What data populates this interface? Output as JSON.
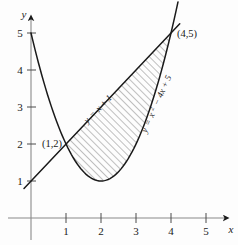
{
  "figure": {
    "title": "",
    "background_color": "#fdfdfd",
    "ink_color": "#1a1a1a",
    "axis_color": "#8a8a8a",
    "hatch_color": "#555555"
  },
  "axes": {
    "x_axis_name": "x",
    "y_axis_name": "y",
    "x_ticks": [
      "1",
      "2",
      "3",
      "4",
      "5"
    ],
    "y_ticks": [
      "1",
      "2",
      "3",
      "4",
      "5"
    ],
    "x_tick_values": [
      1,
      2,
      3,
      4,
      5
    ],
    "y_tick_values": [
      1,
      2,
      3,
      4,
      5
    ],
    "xlim": [
      -0.35,
      5.6
    ],
    "ylim": [
      -0.45,
      5.6
    ],
    "grid": false
  },
  "curve_labels": {
    "line": {
      "lhs": "y",
      "eq": "=",
      "rhs": "x + 1",
      "full": "y = x + 1"
    },
    "parabola": {
      "lhs": "y",
      "eq": "=",
      "rhs_base": "x",
      "rhs_exp": "2",
      "rhs_rest": "− 4x + 5",
      "full": "y = x² − 4x + 5"
    }
  },
  "point_labels": [
    {
      "text": "(1,2)",
      "x": 1,
      "y": 2
    },
    {
      "text": "(4,5)",
      "x": 4,
      "y": 5
    }
  ],
  "chart_data": {
    "type": "line",
    "title": "",
    "xlabel": "x",
    "ylabel": "y",
    "xlim": [
      -0.35,
      5.6
    ],
    "ylim": [
      -0.45,
      5.6
    ],
    "grid": false,
    "legend_position": "inline-along-curves",
    "series": [
      {
        "name": "y = x + 1",
        "kind": "line",
        "equation": "y = x + 1",
        "domain": [
          -0.2,
          4.25
        ],
        "points": [
          {
            "x": -0.2,
            "y": 0.8
          },
          {
            "x": 0,
            "y": 1
          },
          {
            "x": 1,
            "y": 2
          },
          {
            "x": 2,
            "y": 3
          },
          {
            "x": 3,
            "y": 4
          },
          {
            "x": 4,
            "y": 5
          },
          {
            "x": 4.25,
            "y": 5.25
          }
        ]
      },
      {
        "name": "y = x² − 4x + 5",
        "kind": "parabola",
        "equation": "y = x^2 - 4x + 5",
        "vertex": {
          "x": 2,
          "y": 1
        },
        "domain": [
          0,
          4.2
        ],
        "points": [
          {
            "x": 0,
            "y": 5
          },
          {
            "x": 0.5,
            "y": 3.25
          },
          {
            "x": 1,
            "y": 2
          },
          {
            "x": 1.5,
            "y": 1.25
          },
          {
            "x": 2,
            "y": 1
          },
          {
            "x": 2.5,
            "y": 1.25
          },
          {
            "x": 3,
            "y": 2
          },
          {
            "x": 3.5,
            "y": 3.25
          },
          {
            "x": 4,
            "y": 5
          },
          {
            "x": 4.2,
            "y": 5.64
          }
        ]
      }
    ],
    "shaded_region": {
      "description": "Region between the line y = x + 1 (upper boundary) and the parabola y = x² − 4x + 5 (lower boundary) from x = 1 to x = 4",
      "fill": "diagonal-hatch",
      "x_from": 1,
      "x_to": 4,
      "upper_curve": "y = x + 1",
      "lower_curve": "y = x² − 4x + 5"
    },
    "intersections": [
      {
        "x": 1,
        "y": 2,
        "label": "(1,2)"
      },
      {
        "x": 4,
        "y": 5,
        "label": "(4,5)"
      }
    ]
  }
}
